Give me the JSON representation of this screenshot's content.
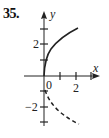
{
  "problem_number": "35.",
  "axes": {
    "x_label": "x",
    "y_label": "y",
    "origin_label": "0",
    "x_tick_labels": [
      {
        "value": 2,
        "text": "2"
      }
    ],
    "y_tick_labels": [
      {
        "value": 2,
        "text": "2"
      },
      {
        "value": -2,
        "text": "−2"
      }
    ],
    "x_ticks": [
      1,
      2,
      3
    ],
    "y_ticks": [
      -3,
      -2,
      -1,
      1,
      2,
      3
    ]
  },
  "curves": [
    {
      "name": "solid-branch",
      "style": "solid",
      "description": "y = 2√x",
      "x_range": [
        0,
        2.8
      ]
    },
    {
      "name": "dashed-branch",
      "style": "dashed",
      "description": "lower branch starting near (0,-1)",
      "x_range": [
        0,
        2.8
      ]
    }
  ],
  "colors": {
    "ink": "#222222",
    "background": "#ffffff"
  }
}
